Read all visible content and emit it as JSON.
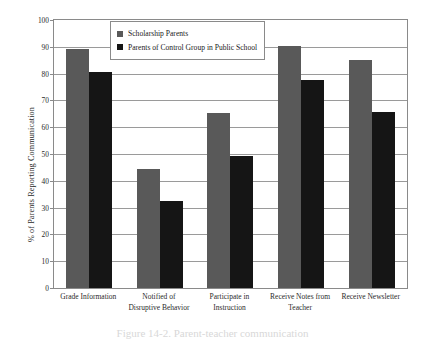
{
  "chart_data": {
    "type": "bar",
    "title": "",
    "xlabel": "",
    "ylabel": "% of Parents Reporting Communication",
    "ylim": [
      0,
      100
    ],
    "ytick_step": 10,
    "yticks": [
      0,
      10,
      20,
      30,
      40,
      50,
      60,
      70,
      80,
      90,
      100
    ],
    "grid": true,
    "legend_position": "top-left-inside",
    "categories": [
      "Grade Information",
      "Notified  of\nDisruptive Behavior",
      "Participate in\nInstruction",
      "Receive Notes from\nTeacher",
      "Receive Newsletter"
    ],
    "category_lines": [
      [
        "Grade Information"
      ],
      [
        "Notified  of",
        "Disruptive Behavior"
      ],
      [
        "Participate in",
        "Instruction"
      ],
      [
        "Receive Notes from",
        "Teacher"
      ],
      [
        "Receive Newsletter"
      ]
    ],
    "series": [
      {
        "name": "Scholarship Parents",
        "color": "#595959",
        "values": [
          89.0,
          44.5,
          65.3,
          90.3,
          85.0
        ]
      },
      {
        "name": "Parents of Control Group in Public School",
        "color": "#151515",
        "values": [
          80.7,
          32.5,
          49.3,
          77.8,
          65.7
        ]
      }
    ]
  },
  "legend": {
    "items": [
      {
        "label": "Scholarship Parents",
        "color": "#595959"
      },
      {
        "label": "Parents of Control Group in Public School",
        "color": "#151515"
      }
    ]
  },
  "caption": {
    "text": "Figure 14-2.  Parent-teacher communication"
  },
  "colors": {
    "series_scholarship": "#595959",
    "series_control": "#151515",
    "axis": "#8a8a8a",
    "grid": "#9a9a9a",
    "background": "#ffffff"
  }
}
